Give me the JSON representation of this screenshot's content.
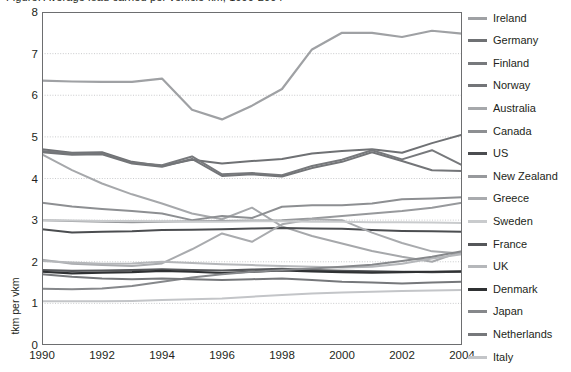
{
  "title": "Figure: Average load carried per vehicle-km, 1990-2004",
  "axis": {
    "y_title": "tkm per vkm",
    "y_ticks": [
      0,
      1,
      2,
      3,
      4,
      5,
      6,
      7,
      8
    ],
    "x_ticks": [
      "1990",
      "1992",
      "1994",
      "1996",
      "1998",
      "2000",
      "2002",
      "2004"
    ]
  },
  "legend": {
    "items": [
      {
        "label": "Ireland",
        "color": "#9fa1a4"
      },
      {
        "label": "Germany",
        "color": "#6f7174"
      },
      {
        "label": "Finland",
        "color": "#77797c"
      },
      {
        "label": "Norway",
        "color": "#737578"
      },
      {
        "label": "Australia",
        "color": "#a6a8ab"
      },
      {
        "label": "Canada",
        "color": "#8d8f92"
      },
      {
        "label": "US",
        "color": "#4b4d50"
      },
      {
        "label": "New Zealand",
        "color": "#97999c"
      },
      {
        "label": "Greece",
        "color": "#a9abae"
      },
      {
        "label": "Sweden",
        "color": "#c9cbcd"
      },
      {
        "label": "France",
        "color": "#55575a"
      },
      {
        "label": "UK",
        "color": "#b5b7ba"
      },
      {
        "label": "Denmark",
        "color": "#2f3133"
      },
      {
        "label": "Japan",
        "color": "#86888b"
      },
      {
        "label": "Netherlands",
        "color": "#76787b"
      },
      {
        "label": "Italy",
        "color": "#c3c5c8"
      }
    ]
  },
  "chart_data": {
    "type": "line",
    "title": "Average load carried per vehicle-km, 1990-2004",
    "xlabel": "",
    "ylabel": "tkm per vkm",
    "xlim": [
      1990,
      2004
    ],
    "ylim": [
      0,
      8
    ],
    "grid": true,
    "legend_position": "right",
    "x": [
      1990,
      1991,
      1992,
      1993,
      1994,
      1995,
      1996,
      1997,
      1998,
      1999,
      2000,
      2001,
      2002,
      2003,
      2004
    ],
    "series": [
      {
        "name": "Ireland",
        "color": "#9fa1a4",
        "width": 2.2,
        "values": [
          6.35,
          6.33,
          6.32,
          6.32,
          6.4,
          5.65,
          5.42,
          5.75,
          6.15,
          7.1,
          7.5,
          7.5,
          7.4,
          7.55,
          7.48
        ]
      },
      {
        "name": "Germany",
        "color": "#6f7174",
        "width": 2.0,
        "values": [
          4.7,
          4.62,
          4.63,
          4.4,
          4.3,
          4.45,
          4.36,
          4.42,
          4.47,
          4.6,
          4.66,
          4.7,
          4.62,
          4.85,
          5.05
        ]
      },
      {
        "name": "Finland",
        "color": "#77797c",
        "width": 2.0,
        "values": [
          4.66,
          4.6,
          4.6,
          4.38,
          4.32,
          4.53,
          4.1,
          4.13,
          4.08,
          4.3,
          4.45,
          4.68,
          4.46,
          4.68,
          4.32
        ]
      },
      {
        "name": "Norway",
        "color": "#737578",
        "width": 2.0,
        "values": [
          4.63,
          4.57,
          4.58,
          4.36,
          4.28,
          4.47,
          4.06,
          4.1,
          4.05,
          4.25,
          4.4,
          4.63,
          4.42,
          4.2,
          4.18
        ]
      },
      {
        "name": "Australia",
        "color": "#a6a8ab",
        "width": 2.0,
        "values": [
          4.58,
          4.2,
          3.88,
          3.62,
          3.4,
          3.16,
          3.02,
          3.3,
          2.85,
          2.62,
          2.44,
          2.26,
          2.12,
          2.0,
          2.25
        ]
      },
      {
        "name": "Canada",
        "color": "#8d8f92",
        "width": 2.0,
        "values": [
          3.42,
          3.33,
          3.27,
          3.22,
          3.16,
          3.0,
          3.1,
          3.05,
          3.32,
          3.36,
          3.36,
          3.4,
          3.5,
          3.52,
          3.55
        ]
      },
      {
        "name": "US",
        "color": "#4b4d50",
        "width": 2.0,
        "values": [
          2.78,
          2.7,
          2.72,
          2.73,
          2.76,
          2.77,
          2.78,
          2.8,
          2.81,
          2.8,
          2.79,
          2.76,
          2.74,
          2.73,
          2.72
        ]
      },
      {
        "name": "New Zealand",
        "color": "#97999c",
        "width": 2.0,
        "values": [
          3.0,
          2.98,
          2.96,
          2.95,
          2.96,
          2.97,
          2.98,
          2.99,
          3.0,
          3.04,
          3.1,
          3.16,
          3.22,
          3.3,
          3.42
        ]
      },
      {
        "name": "Greece",
        "color": "#a9abae",
        "width": 2.0,
        "values": [
          2.05,
          1.95,
          1.92,
          1.9,
          1.96,
          2.3,
          2.68,
          2.48,
          2.9,
          3.02,
          3.0,
          2.7,
          2.45,
          2.25,
          2.2
        ]
      },
      {
        "name": "Sweden",
        "color": "#c9cbcd",
        "width": 2.0,
        "values": [
          3.0,
          2.99,
          2.98,
          2.98,
          2.97,
          2.96,
          2.96,
          2.97,
          2.97,
          2.96,
          2.96,
          2.95,
          2.95,
          2.94,
          2.93
        ]
      },
      {
        "name": "France",
        "color": "#55575a",
        "width": 2.2,
        "values": [
          1.8,
          1.78,
          1.79,
          1.8,
          1.82,
          1.8,
          1.79,
          1.81,
          1.83,
          1.8,
          1.78,
          1.77,
          1.76,
          1.75,
          1.76
        ]
      },
      {
        "name": "UK",
        "color": "#b5b7ba",
        "width": 2.0,
        "values": [
          2.02,
          1.98,
          1.95,
          1.96,
          2.0,
          1.97,
          1.94,
          1.92,
          1.9,
          1.88,
          1.86,
          1.88,
          1.95,
          2.08,
          2.18
        ]
      },
      {
        "name": "Denmark",
        "color": "#2f3133",
        "width": 2.2,
        "values": [
          1.76,
          1.72,
          1.74,
          1.75,
          1.78,
          1.76,
          1.73,
          1.76,
          1.79,
          1.77,
          1.75,
          1.74,
          1.75,
          1.76,
          1.77
        ]
      },
      {
        "name": "Japan",
        "color": "#86888b",
        "width": 2.0,
        "values": [
          1.35,
          1.34,
          1.36,
          1.42,
          1.52,
          1.62,
          1.7,
          1.76,
          1.8,
          1.84,
          1.88,
          1.93,
          2.02,
          2.12,
          2.25
        ]
      },
      {
        "name": "Netherlands",
        "color": "#76787b",
        "width": 2.0,
        "values": [
          1.7,
          1.64,
          1.6,
          1.58,
          1.6,
          1.58,
          1.56,
          1.58,
          1.6,
          1.56,
          1.52,
          1.5,
          1.48,
          1.5,
          1.52
        ]
      },
      {
        "name": "Italy",
        "color": "#c3c5c8",
        "width": 2.0,
        "values": [
          1.05,
          1.05,
          1.05,
          1.06,
          1.08,
          1.1,
          1.12,
          1.16,
          1.2,
          1.24,
          1.26,
          1.28,
          1.3,
          1.31,
          1.32
        ]
      }
    ]
  }
}
